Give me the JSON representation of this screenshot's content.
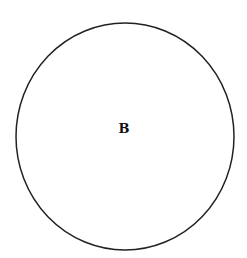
{
  "diagram": {
    "shapes": [
      {
        "type": "ellipse",
        "label": "B",
        "stroke": "#222222",
        "fill": "#ffffff"
      }
    ]
  }
}
